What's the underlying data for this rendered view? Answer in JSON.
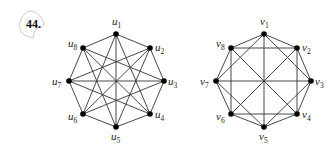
{
  "problem": {
    "number_label": "44.",
    "circled": true
  },
  "graphs": [
    {
      "id": "left",
      "vertex_prefix": "u",
      "vertices": [
        {
          "name": "u1",
          "sub": "1",
          "x": 116,
          "y": 34,
          "lx": 112,
          "ly": 25
        },
        {
          "name": "u2",
          "sub": "2",
          "x": 150,
          "y": 48,
          "lx": 155,
          "ly": 51
        },
        {
          "name": "u3",
          "sub": "3",
          "x": 164,
          "y": 81,
          "lx": 168,
          "ly": 85
        },
        {
          "name": "u4",
          "sub": "4",
          "x": 150,
          "y": 114,
          "lx": 155,
          "ly": 118
        },
        {
          "name": "u5",
          "sub": "5",
          "x": 116,
          "y": 127,
          "lx": 111,
          "ly": 140
        },
        {
          "name": "u6",
          "sub": "6",
          "x": 83,
          "y": 114,
          "lx": 68,
          "ly": 120
        },
        {
          "name": "u7",
          "sub": "7",
          "x": 69,
          "y": 81,
          "lx": 52,
          "ly": 85
        },
        {
          "name": "u8",
          "sub": "8",
          "x": 83,
          "y": 48,
          "lx": 68,
          "ly": 47
        }
      ],
      "edge_rule": "cycle distances 1, 3, 4",
      "edges": [
        [
          0,
          1
        ],
        [
          1,
          2
        ],
        [
          2,
          3
        ],
        [
          3,
          4
        ],
        [
          4,
          5
        ],
        [
          5,
          6
        ],
        [
          6,
          7
        ],
        [
          7,
          0
        ],
        [
          0,
          3
        ],
        [
          1,
          4
        ],
        [
          2,
          5
        ],
        [
          3,
          6
        ],
        [
          4,
          7
        ],
        [
          5,
          0
        ],
        [
          6,
          1
        ],
        [
          7,
          2
        ],
        [
          0,
          4
        ],
        [
          1,
          5
        ],
        [
          2,
          6
        ],
        [
          3,
          7
        ]
      ]
    },
    {
      "id": "right",
      "vertex_prefix": "v",
      "vertices": [
        {
          "name": "v1",
          "sub": "1",
          "x": 264,
          "y": 34,
          "lx": 260,
          "ly": 25
        },
        {
          "name": "v2",
          "sub": "2",
          "x": 297,
          "y": 48,
          "lx": 302,
          "ly": 51
        },
        {
          "name": "v3",
          "sub": "3",
          "x": 311,
          "y": 81,
          "lx": 315,
          "ly": 85
        },
        {
          "name": "v4",
          "sub": "4",
          "x": 297,
          "y": 114,
          "lx": 302,
          "ly": 118
        },
        {
          "name": "v5",
          "sub": "5",
          "x": 264,
          "y": 127,
          "lx": 259,
          "ly": 140
        },
        {
          "name": "v6",
          "sub": "6",
          "x": 231,
          "y": 114,
          "lx": 216,
          "ly": 120
        },
        {
          "name": "v7",
          "sub": "7",
          "x": 216,
          "y": 81,
          "lx": 200,
          "ly": 85
        },
        {
          "name": "v8",
          "sub": "8",
          "x": 231,
          "y": 48,
          "lx": 216,
          "ly": 47
        }
      ],
      "edge_rule": "cycle distances 1, 2, 4",
      "edges": [
        [
          0,
          1
        ],
        [
          1,
          2
        ],
        [
          2,
          3
        ],
        [
          3,
          4
        ],
        [
          4,
          5
        ],
        [
          5,
          6
        ],
        [
          6,
          7
        ],
        [
          7,
          0
        ],
        [
          0,
          2
        ],
        [
          1,
          3
        ],
        [
          2,
          4
        ],
        [
          3,
          5
        ],
        [
          4,
          6
        ],
        [
          5,
          7
        ],
        [
          6,
          0
        ],
        [
          7,
          1
        ],
        [
          0,
          4
        ],
        [
          1,
          5
        ],
        [
          2,
          6
        ],
        [
          3,
          7
        ]
      ]
    }
  ],
  "colors": {
    "edge": "#333333",
    "node": "#000000",
    "label": "#222222",
    "circle": "#bbbbbb"
  }
}
